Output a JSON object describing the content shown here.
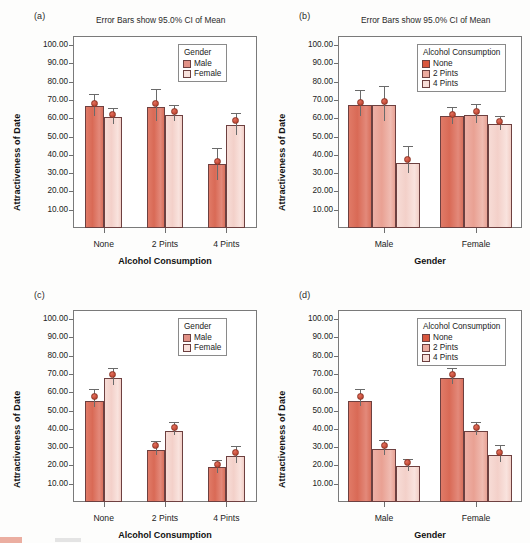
{
  "figure": {
    "panels": [
      {
        "letter": "(a)",
        "supertitle": "Error Bars show 95.0% CI of Mean",
        "legend_title": "Gender",
        "legend_items": [
          "Male",
          "Female"
        ],
        "xlabel": "Alcohol Consumption",
        "ylabel": "Attractiveness of Date",
        "xticks": [
          "None",
          "2 Pints",
          "4 Pints"
        ],
        "yticks": [
          "100.00",
          "90.00",
          "80.00",
          "70.00",
          "60.00",
          "50.00",
          "40.00",
          "30.00",
          "20.00",
          "10.00"
        ]
      },
      {
        "letter": "(b)",
        "supertitle": "Error Bars show 95.0% CI of Mean",
        "legend_title": "Alcohol Consumption",
        "legend_items": [
          "None",
          "2 Pints",
          "4 Pints"
        ],
        "xlabel": "Gender",
        "ylabel": "Attractiveness of Date",
        "xticks": [
          "Male",
          "Female"
        ],
        "yticks": [
          "100.00",
          "90.00",
          "80.00",
          "70.00",
          "60.00",
          "50.00",
          "40.00",
          "30.00",
          "20.00",
          "10.00"
        ]
      },
      {
        "letter": "(c)",
        "supertitle": "",
        "legend_title": "Gender",
        "legend_items": [
          "Male",
          "Female"
        ],
        "xlabel": "Alcohol Consumption",
        "ylabel": "Attractiveness of Date",
        "xticks": [
          "None",
          "2 Pints",
          "4 Pints"
        ],
        "yticks": [
          "100.00",
          "90.00",
          "80.00",
          "70.00",
          "60.00",
          "50.00",
          "40.00",
          "30.00",
          "20.00",
          "10.00"
        ]
      },
      {
        "letter": "(d)",
        "supertitle": "",
        "legend_title": "Alcohol Consumption",
        "legend_items": [
          "None",
          "2 Pints",
          "4 Pints"
        ],
        "xlabel": "Gender",
        "ylabel": "Attractiveness of Date",
        "xticks": [
          "Male",
          "Female"
        ],
        "yticks": [
          "100.00",
          "90.00",
          "80.00",
          "70.00",
          "60.00",
          "50.00",
          "40.00",
          "30.00",
          "20.00",
          "10.00"
        ]
      }
    ]
  },
  "chart_data": [
    {
      "id": "a",
      "type": "bar",
      "title": "Error Bars show 95.0% CI of Mean",
      "xlabel": "Alcohol Consumption",
      "ylabel": "Attractiveness of Date",
      "ylim": [
        0,
        105
      ],
      "yticks": [
        10,
        20,
        30,
        40,
        50,
        60,
        70,
        80,
        90,
        100
      ],
      "grid": false,
      "legend_title": "Gender",
      "legend_position": "top-right",
      "categories": [
        "None",
        "2 Pints",
        "4 Pints"
      ],
      "series": [
        {
          "name": "Male",
          "color": "#d9705c",
          "values": [
            66.5,
            66.0,
            35.0
          ],
          "ci_low": [
            61.5,
            58.5,
            26.0
          ],
          "ci_high": [
            73.5,
            76.0,
            44.0
          ],
          "markers": [
            68.0,
            68.0,
            36.5
          ]
        },
        {
          "name": "Female",
          "color": "#f3d0c9",
          "values": [
            60.5,
            62.0,
            56.5
          ],
          "ci_low": [
            57.0,
            58.5,
            51.0
          ],
          "ci_high": [
            65.5,
            67.0,
            63.0
          ],
          "markers": [
            62.0,
            63.5,
            59.0
          ]
        }
      ]
    },
    {
      "id": "b",
      "type": "bar",
      "title": "Error Bars show 95.0% CI of Mean",
      "xlabel": "Gender",
      "ylabel": "Attractiveness of Date",
      "ylim": [
        0,
        105
      ],
      "yticks": [
        10,
        20,
        30,
        40,
        50,
        60,
        70,
        80,
        90,
        100
      ],
      "grid": false,
      "legend_title": "Alcohol Consumption",
      "legend_position": "top-right",
      "categories": [
        "Male",
        "Female"
      ],
      "series": [
        {
          "name": "None",
          "color": "#d9705c",
          "values": [
            67.0,
            61.0
          ],
          "ci_low": [
            61.5,
            57.0
          ],
          "ci_high": [
            75.5,
            66.0
          ],
          "markers": [
            68.5,
            62.0
          ]
        },
        {
          "name": "2 Pints",
          "color": "#ecaa9e",
          "values": [
            67.0,
            62.0
          ],
          "ci_low": [
            58.5,
            57.5
          ],
          "ci_high": [
            77.5,
            68.0
          ],
          "markers": [
            69.0,
            63.5
          ]
        },
        {
          "name": "4 Pints",
          "color": "#f3d0c9",
          "values": [
            35.5,
            57.0
          ],
          "ci_low": [
            30.0,
            53.5
          ],
          "ci_high": [
            45.0,
            61.5
          ],
          "markers": [
            37.5,
            58.5
          ]
        }
      ]
    },
    {
      "id": "c",
      "type": "bar",
      "title": "",
      "xlabel": "Alcohol Consumption",
      "ylabel": "Attractiveness of Date",
      "ylim": [
        0,
        105
      ],
      "yticks": [
        10,
        20,
        30,
        40,
        50,
        60,
        70,
        80,
        90,
        100
      ],
      "grid": false,
      "legend_title": "Gender",
      "legend_position": "top-right",
      "categories": [
        "None",
        "2 Pints",
        "4 Pints"
      ],
      "series": [
        {
          "name": "Male",
          "color": "#d9705c",
          "values": [
            55.5,
            28.5,
            19.0
          ],
          "ci_low": [
            52.0,
            25.5,
            16.0
          ],
          "ci_high": [
            62.0,
            33.5,
            23.0
          ],
          "markers": [
            57.5,
            31.0,
            20.5
          ]
        },
        {
          "name": "Female",
          "color": "#f3d0c9",
          "values": [
            68.0,
            39.0,
            25.0
          ],
          "ci_low": [
            64.0,
            36.5,
            21.5
          ],
          "ci_high": [
            73.5,
            43.5,
            30.5
          ],
          "markers": [
            70.0,
            41.0,
            27.0
          ]
        }
      ]
    },
    {
      "id": "d",
      "type": "bar",
      "title": "",
      "xlabel": "Gender",
      "ylabel": "Attractiveness of Date",
      "ylim": [
        0,
        105
      ],
      "yticks": [
        10,
        20,
        30,
        40,
        50,
        60,
        70,
        80,
        90,
        100
      ],
      "grid": false,
      "legend_title": "Alcohol Consumption",
      "legend_position": "top-right",
      "categories": [
        "Male",
        "Female"
      ],
      "series": [
        {
          "name": "None",
          "color": "#d9705c",
          "values": [
            55.5,
            68.0
          ],
          "ci_low": [
            52.5,
            64.5
          ],
          "ci_high": [
            62.0,
            73.5
          ],
          "markers": [
            57.5,
            70.0
          ]
        },
        {
          "name": "2 Pints",
          "color": "#ecaa9e",
          "values": [
            29.0,
            39.0
          ],
          "ci_low": [
            25.5,
            36.5
          ],
          "ci_high": [
            34.0,
            43.5
          ],
          "markers": [
            31.0,
            41.0
          ]
        },
        {
          "name": "4 Pints",
          "color": "#f3d0c9",
          "values": [
            19.5,
            25.5
          ],
          "ci_low": [
            17.0,
            22.0
          ],
          "ci_high": [
            23.5,
            31.0
          ],
          "markers": [
            21.5,
            27.0
          ]
        }
      ]
    }
  ]
}
